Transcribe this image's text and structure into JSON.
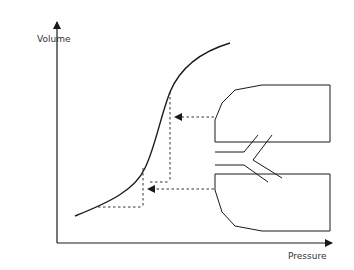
{
  "diagram": {
    "type": "pressure-volume curve with lung/alveoli schematic",
    "axes": {
      "y_label": "Volume",
      "x_label": "Pressure"
    },
    "elements": [
      {
        "name": "pv-curve",
        "description": "sigmoid pressure-volume curve"
      },
      {
        "name": "upper-projection",
        "description": "dashed projection from upper lung region to curve with arrow"
      },
      {
        "name": "lower-projection",
        "description": "dashed projection from lower lung region to curve with arrow"
      },
      {
        "name": "lung-schematic",
        "description": "two lung regions connected by Y-shaped airway"
      }
    ],
    "colors": {
      "line": "#1a1a1a",
      "dashed": "#333333",
      "background": "#ffffff"
    }
  }
}
